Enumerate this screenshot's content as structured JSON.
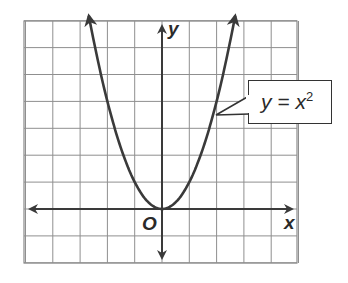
{
  "chart_data": {
    "type": "line",
    "title": "",
    "equation_label": "y = x²",
    "series": [
      {
        "name": "y = x^2",
        "function": "x^2",
        "x": [
          -2.65,
          -2,
          -1.5,
          -1,
          -0.5,
          0,
          0.5,
          1,
          1.5,
          2,
          2.65
        ],
        "y": [
          7.02,
          4,
          2.25,
          1,
          0.25,
          0,
          0.25,
          1,
          2.25,
          4,
          7.02
        ]
      }
    ],
    "xlabel": "x",
    "ylabel": "y",
    "origin_label": "O",
    "xlim": [
      -5,
      5
    ],
    "ylim": [
      -2,
      7
    ],
    "grid": true,
    "arrows_on_ends": true
  },
  "labels": {
    "x_axis": "x",
    "y_axis": "y",
    "origin": "O",
    "callout_base": "y = x",
    "callout_exp": "2"
  }
}
